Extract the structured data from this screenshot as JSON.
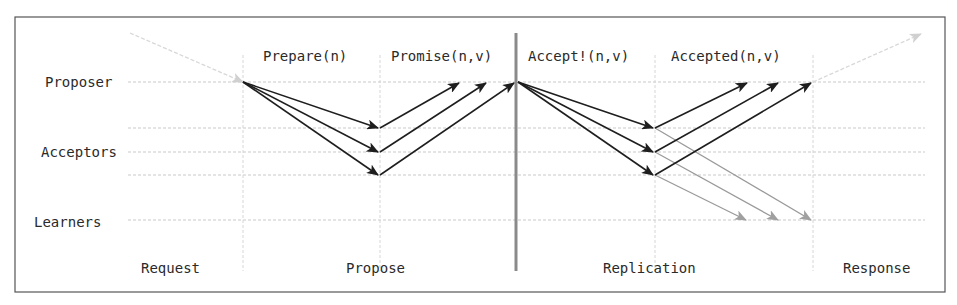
{
  "roles": {
    "proposer": "Proposer",
    "acceptors": "Acceptors",
    "learners": "Learners"
  },
  "messages": {
    "prepare": "Prepare(n)",
    "promise": "Promise(n,v)",
    "accept": "Accept!(n,v)",
    "accepted": "Accepted(n,v)"
  },
  "phases": {
    "request": "Request",
    "propose": "Propose",
    "replication": "Replication",
    "response": "Response"
  },
  "colors": {
    "message_arrow": "#1e1e1e",
    "learner_arrow": "#9a9a9a",
    "client_arrow": "#d8d8d8",
    "divider": "#8a8a8a"
  }
}
